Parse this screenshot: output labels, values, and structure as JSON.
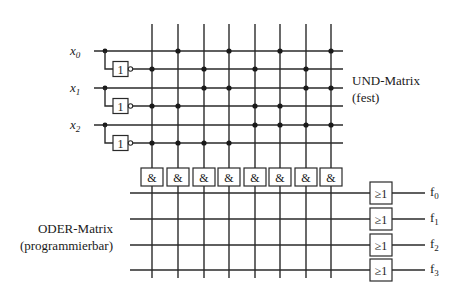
{
  "diagram": {
    "type": "PLA / PROM structure",
    "and_matrix": {
      "title": "UND-Matrix",
      "subtitle": "(fest)"
    },
    "or_matrix": {
      "title": "ODER-Matrix",
      "subtitle": "(programmierbar)"
    },
    "inputs": [
      {
        "name": "x",
        "sub": "0"
      },
      {
        "name": "x",
        "sub": "1"
      },
      {
        "name": "x",
        "sub": "2"
      }
    ],
    "inverter_label": "1",
    "and_gate_label": "&",
    "or_gate_label": "≥1",
    "outputs": [
      {
        "name": "f",
        "sub": "0"
      },
      {
        "name": "f",
        "sub": "1"
      },
      {
        "name": "f",
        "sub": "2"
      },
      {
        "name": "f",
        "sub": "3"
      }
    ],
    "and_columns": 8,
    "and_rows": [
      "x0",
      "not x0",
      "x1",
      "not x1",
      "x2",
      "not x2"
    ],
    "and_connections": [
      [
        0,
        1,
        0,
        1,
        0,
        1,
        0,
        1
      ],
      [
        1,
        0,
        1,
        0,
        1,
        0,
        1,
        0
      ],
      [
        0,
        0,
        1,
        1,
        0,
        0,
        1,
        1
      ],
      [
        1,
        1,
        0,
        0,
        1,
        1,
        0,
        0
      ],
      [
        0,
        0,
        0,
        0,
        1,
        1,
        1,
        1
      ],
      [
        1,
        1,
        1,
        1,
        0,
        0,
        0,
        0
      ]
    ],
    "or_connections": [
      [
        0,
        0,
        0,
        0,
        0,
        0,
        0,
        0
      ],
      [
        0,
        0,
        0,
        0,
        0,
        0,
        0,
        0
      ],
      [
        0,
        0,
        0,
        0,
        0,
        0,
        0,
        0
      ],
      [
        0,
        0,
        0,
        0,
        0,
        0,
        0,
        0
      ]
    ],
    "colors": {
      "line": "#2a2a2a",
      "background": "#ffffff"
    }
  }
}
